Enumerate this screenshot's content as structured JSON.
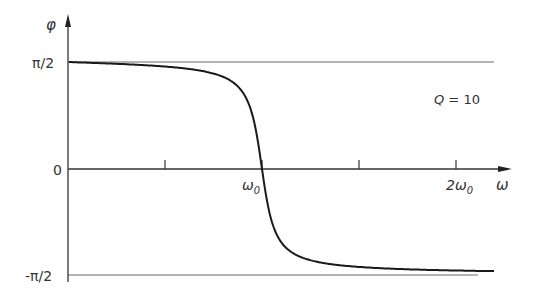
{
  "chart_data": {
    "type": "line",
    "title": "",
    "subtitle": "",
    "xlabel": "ω",
    "ylabel": "φ",
    "annotation": "Q = 10",
    "quality_factor": 10,
    "x_ticks": [
      {
        "value": 0.5,
        "label": ""
      },
      {
        "value": 1.0,
        "label": "ω0"
      },
      {
        "value": 1.5,
        "label": ""
      },
      {
        "value": 2.0,
        "label": "2ω0"
      }
    ],
    "y_ticks": [
      {
        "value": 1.5708,
        "label": "π/2"
      },
      {
        "value": 0,
        "label": "0"
      },
      {
        "value": -1.5708,
        "label": "-π/2"
      }
    ],
    "xlim": [
      0,
      2.15
    ],
    "ylim": [
      -1.5708,
      1.5708
    ],
    "grid": false,
    "legend": null,
    "reference_lines": [
      {
        "y": 1.5708,
        "label": "π/2"
      },
      {
        "y": -1.5708,
        "label": "-π/2"
      }
    ],
    "series": [
      {
        "name": "phase φ(ω), Q = 10",
        "formula": "φ = arctan(Q(ω0/ω − ω/ω0))",
        "x": [
          0.0,
          0.1,
          0.2,
          0.3,
          0.4,
          0.5,
          0.6,
          0.7,
          0.8,
          0.85,
          0.9,
          0.95,
          1.0,
          1.05,
          1.1,
          1.15,
          1.2,
          1.3,
          1.4,
          1.5,
          1.6,
          1.7,
          1.8,
          1.9,
          2.0,
          2.1
        ],
        "y": [
          1.571,
          1.561,
          1.55,
          1.537,
          1.519,
          1.504,
          1.475,
          1.437,
          1.361,
          1.294,
          1.19,
          0.867,
          0.0,
          -0.788,
          -1.126,
          -1.305,
          -1.376,
          -1.442,
          -1.481,
          -1.506,
          -1.522,
          -1.534,
          -1.543,
          -1.549,
          -1.556,
          -1.561
        ]
      }
    ]
  },
  "labels": {
    "y_axis": "φ",
    "x_axis": "ω",
    "y_top": "π/2",
    "y_zero": "0",
    "y_bottom": "-π/2",
    "x_w0": "ω",
    "x_w0_sub": "0",
    "x_2w0_coef": "2ω",
    "x_2w0_sub": "0",
    "q_letter": "Q",
    "q_rest": " = 10"
  },
  "colors": {
    "curve": "#1a1a1a",
    "axes": "#333333",
    "reference": "#666666"
  }
}
